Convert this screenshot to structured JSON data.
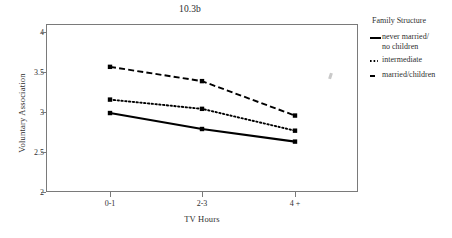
{
  "chart_data": {
    "type": "line",
    "title": "10.3b",
    "xlabel": "TV Hours",
    "ylabel": "Voluntary Association",
    "categories": [
      "0-1",
      "2-3",
      "4 +"
    ],
    "ylim": [
      2,
      4
    ],
    "yticks": [
      2,
      2.5,
      3,
      3.5,
      4
    ],
    "ytick_labels": [
      "2",
      "2.5",
      "3",
      "3.5",
      "4"
    ],
    "grid": false,
    "legend_position": "right",
    "legend_title": "Family Structure",
    "series": [
      {
        "name": "never married/\nno children",
        "style": "solid",
        "color": "#000000",
        "values": [
          2.94,
          2.75,
          2.6
        ]
      },
      {
        "name": "intermediate",
        "style": "dotted",
        "color": "#000000",
        "values": [
          3.1,
          2.99,
          2.73
        ]
      },
      {
        "name": "married/children",
        "style": "dashed",
        "color": "#000000",
        "values": [
          3.49,
          3.32,
          2.91
        ]
      }
    ]
  }
}
